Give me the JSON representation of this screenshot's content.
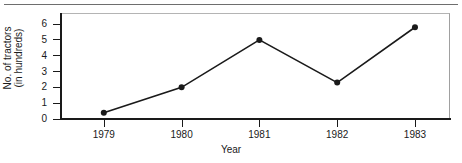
{
  "chart_data": {
    "type": "line",
    "title": "",
    "xlabel": "Year",
    "ylabel": "No. of tractors (in hundreds)",
    "ylabel_lines": [
      "No. of tractors",
      "(in hundreds)"
    ],
    "categories": [
      "1979",
      "1980",
      "1981",
      "1982",
      "1983"
    ],
    "x": [
      1979,
      1980,
      1981,
      1982,
      1983
    ],
    "values": [
      0.4,
      2.0,
      5.0,
      2.3,
      5.8
    ],
    "series": [
      {
        "name": "No. of tractors (in hundreds)",
        "values": [
          0.4,
          2.0,
          5.0,
          2.3,
          5.8
        ]
      }
    ],
    "ylim": [
      0,
      6.7
    ],
    "xlim": [
      1978.45,
      1983.45
    ],
    "ytick_labels": [
      "0",
      "1",
      "2",
      "3",
      "4",
      "5",
      "6"
    ],
    "ytick_values": [
      0,
      1,
      2,
      3,
      4,
      5,
      6
    ],
    "xtick_labels": [
      "1979",
      "1980",
      "1981",
      "1982",
      "1983"
    ],
    "grid": false,
    "legend": false,
    "legend_position": "none",
    "marker": "filled-circle",
    "line_color": "#1a1a1a",
    "marker_color": "#1a1a1a",
    "background_color": "#ffffff",
    "axis_color": "#1a1a1a",
    "frame_color": "#b4b4b4"
  }
}
